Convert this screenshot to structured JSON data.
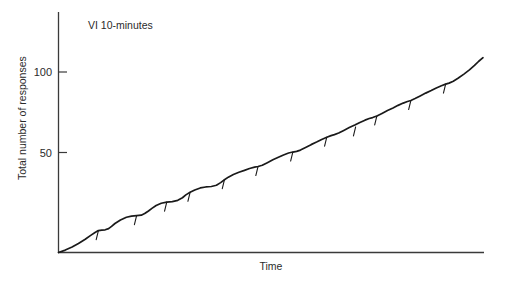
{
  "chart_data": {
    "type": "line",
    "title": "",
    "annotation": "VI 10-minutes",
    "xlabel": "Time",
    "ylabel": "Total number of responses",
    "ytick_labels": [
      "50",
      "100"
    ],
    "ytick_values": [
      50,
      100
    ],
    "ylim": [
      0,
      146
    ],
    "xlim": [
      0,
      100
    ],
    "grid": false,
    "legend": "none",
    "series": [
      {
        "name": "Cumulative responses",
        "color": "#1a1a1a",
        "description": "Cumulative record of responding on a variable-interval 10-minute schedule; steady near-linear accumulation with slight scallops and brief post-reinforcement pauses.",
        "x": [
          0,
          1.6,
          3.2,
          4.7,
          6.3,
          7.5,
          8.6,
          9.4,
          10.2,
          11.0,
          11.8,
          12.5,
          13.3,
          14.6,
          16.0,
          17.2,
          18.4,
          19.5,
          20.3,
          21.2,
          22.0,
          23.0,
          24.2,
          25.5,
          26.8,
          28.1,
          29.2,
          30.0,
          31.0,
          32.1,
          33.4,
          34.7,
          36.0,
          37.2,
          38.2,
          39.1,
          40.0,
          41.2,
          42.5,
          43.8,
          45.0,
          46.2,
          47.0,
          48.0,
          49.2,
          50.5,
          51.8,
          53.0,
          54.2,
          55.2,
          56.1,
          57.0,
          58.2,
          59.5,
          60.8,
          62.0,
          63.2,
          64.2,
          65.0,
          66.0,
          67.2,
          68.5,
          69.8,
          71.0,
          72.2,
          73.2,
          74.0,
          75.0,
          76.2,
          77.5,
          78.8,
          80.0,
          81.2,
          82.2,
          83.0,
          84.0,
          85.2,
          86.5,
          87.8,
          89.0,
          90.2,
          91.2,
          92.0,
          93.0,
          94.2,
          95.5,
          96.8,
          98.0,
          99.0,
          100.0
        ],
        "y": [
          0,
          1.5,
          3.4,
          5.6,
          8.2,
          10.5,
          12.4,
          13.6,
          13.9,
          14.1,
          14.8,
          16.2,
          18.0,
          20.2,
          21.9,
          22.6,
          22.9,
          23.2,
          24.2,
          25.8,
          27.4,
          29.2,
          30.6,
          31.3,
          31.6,
          32.4,
          34.0,
          35.8,
          37.4,
          38.8,
          40.1,
          40.7,
          41.0,
          41.8,
          43.4,
          45.2,
          46.8,
          48.4,
          49.8,
          51.0,
          52.2,
          53.0,
          53.4,
          54.2,
          55.8,
          57.6,
          59.2,
          60.6,
          61.8,
          62.4,
          62.8,
          63.6,
          65.2,
          67.0,
          68.6,
          70.2,
          71.6,
          72.6,
          73.2,
          74.2,
          75.8,
          77.6,
          79.2,
          80.8,
          82.2,
          83.2,
          83.8,
          84.8,
          86.4,
          88.2,
          89.8,
          91.4,
          92.8,
          93.8,
          94.4,
          95.6,
          97.2,
          99.0,
          100.6,
          102.2,
          103.6,
          104.6,
          105.2,
          106.4,
          108.4,
          110.8,
          113.4,
          116.2,
          118.8,
          121.0
        ]
      }
    ],
    "reinforcement_marks": {
      "name": "Reinforcement pips",
      "symbol": "downward hash mark on record",
      "count": 12,
      "x": [
        9.4,
        18.4,
        25.5,
        31.0,
        39.1,
        47.0,
        55.2,
        63.2,
        70.0,
        75.0,
        83.0,
        91.2
      ],
      "y": [
        13.6,
        22.9,
        31.3,
        37.4,
        45.2,
        53.4,
        62.4,
        71.6,
        78.0,
        84.8,
        94.4,
        104.6
      ]
    }
  },
  "axes": {
    "y_label": "Total number of responses",
    "x_label": "Time",
    "ticks": [
      {
        "label": "100",
        "value": 100
      },
      {
        "label": "50",
        "value": 50
      }
    ]
  },
  "annotations": {
    "schedule": "VI 10-minutes"
  },
  "colors": {
    "line": "#1a1a1a",
    "axis": "#3a3a3a",
    "text": "#2b2b2b",
    "background": "#ffffff"
  }
}
